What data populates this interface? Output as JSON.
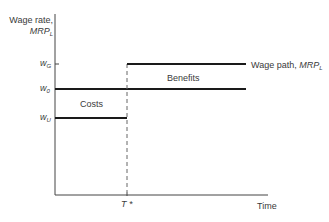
{
  "diagram": {
    "y_axis_label_line1": "Wage rate,",
    "y_axis_label_line2": "MRP",
    "y_axis_label_sub": "L",
    "x_axis_label": "Time",
    "ticks_y": [
      {
        "label": "w",
        "sub": "G"
      },
      {
        "label": "w",
        "sub": "0"
      },
      {
        "label": "w",
        "sub": "U"
      }
    ],
    "tick_x": "T *",
    "region_costs": "Costs",
    "region_benefits": "Benefits",
    "wage_path_label": "Wage path, ",
    "wage_path_mrp": "MRP",
    "wage_path_sub": "L",
    "colors": {
      "line": "#1a1a1a",
      "axis": "#3a3a3a",
      "text": "#3a3a3a"
    }
  }
}
